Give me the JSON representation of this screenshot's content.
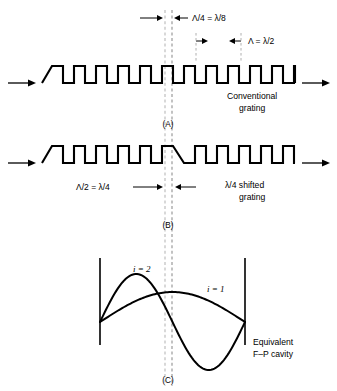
{
  "figure": {
    "background_color": "#ffffff",
    "line_color": "#000000",
    "dash_color": "#b0b0b0"
  },
  "panels": [
    {
      "id": "A",
      "panel_label": "(A)",
      "caption_line1": "Conventional",
      "caption_line2": "grating",
      "grating": {
        "type": "square-wave",
        "phase_shifted": false,
        "period_px": 22,
        "duty_cycle": 0.5,
        "teeth_count": 11,
        "baseline_y": 83,
        "top_y": 66,
        "x_start": 42,
        "x_end": 295
      },
      "flow_arrow_in": "→",
      "flow_arrow_out": "→"
    },
    {
      "id": "B",
      "panel_label": "(B)",
      "caption_line1": "λ/4 shifted",
      "caption_line2": "grating",
      "grating": {
        "type": "square-wave",
        "phase_shifted": true,
        "shift_amount": "Λ/2",
        "period_px": 22,
        "duty_cycle": 0.5,
        "teeth_count": 10,
        "baseline_y": 163,
        "top_y": 146,
        "x_start": 42,
        "x_end": 295
      },
      "flow_arrow_in": "→",
      "flow_arrow_out": "→"
    },
    {
      "id": "C",
      "panel_label": "(C)",
      "caption_line1": "Equivalent",
      "caption_line2": "F–P cavity",
      "cavity": {
        "left_mirror_x": 100,
        "right_mirror_x": 245,
        "mirror_top_y": 258,
        "mirror_bottom_y": 345,
        "center_x": 172
      }
    }
  ],
  "dimension_labels": [
    {
      "id": "quarter-shift",
      "text": "Λ/4 = λ/8",
      "text_x": 192,
      "text_y": 21,
      "left_arrow_from": 140,
      "left_arrow_to": 163,
      "right_arrow_from": 188,
      "right_arrow_to": 174,
      "arrow_y": 18
    },
    {
      "id": "grating-period",
      "text": "Λ = λ/2",
      "text_x": 248,
      "text_y": 44,
      "left_arrow_from": 196,
      "left_arrow_to": 208,
      "right_arrow_from": 241,
      "right_arrow_to": 229,
      "arrow_y": 41,
      "tick_x_left": 196,
      "tick_x_right": 241
    },
    {
      "id": "half-period-shift",
      "text": "Λ/2 = λ/4",
      "text_x": 76,
      "text_y": 190,
      "left_arrow_from": 133,
      "left_arrow_to": 163,
      "right_arrow_from": 196,
      "right_arrow_to": 175,
      "arrow_y": 187
    }
  ],
  "mode_curves": [
    {
      "id": "mode-i-2",
      "label": "i = 2",
      "label_x": 133,
      "label_y": 272,
      "description": "full sine lobe, positive then negative, one node at cavity center"
    },
    {
      "id": "mode-i-1",
      "label": "i = 1",
      "label_x": 207,
      "label_y": 292,
      "description": "single half-sine lobe spanning the cavity"
    }
  ],
  "center_lines": {
    "light_dash_x": 165,
    "dark_dash_x": 172,
    "top_y": 10,
    "bottom_y": 386
  }
}
